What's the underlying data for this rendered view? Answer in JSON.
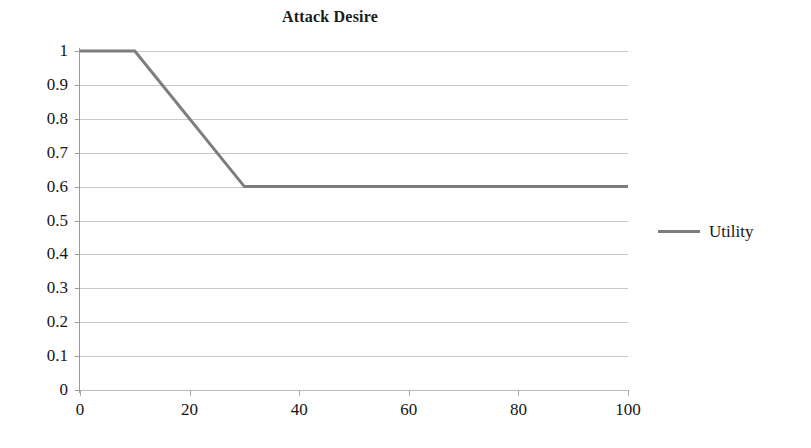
{
  "chart_data": {
    "type": "line",
    "title": "Attack Desire",
    "xlabel": "",
    "ylabel": "",
    "xlim": [
      0,
      100
    ],
    "ylim": [
      0,
      1
    ],
    "grid": true,
    "legend_position": "right",
    "x_ticks": [
      0,
      20,
      40,
      60,
      80,
      100
    ],
    "y_ticks": [
      0,
      0.1,
      0.2,
      0.3,
      0.4,
      0.5,
      0.6,
      0.7,
      0.8,
      0.9,
      1
    ],
    "x_tick_labels": [
      "0",
      "20",
      "40",
      "60",
      "80",
      "100"
    ],
    "y_tick_labels": [
      "0",
      "0.1",
      "0.2",
      "0.3",
      "0.4",
      "0.5",
      "0.6",
      "0.7",
      "0.8",
      "0.9",
      "1"
    ],
    "series": [
      {
        "name": "Utility",
        "color": "#7d7d7d",
        "x": [
          0,
          10,
          30,
          100
        ],
        "values": [
          1,
          1,
          0.6,
          0.6
        ]
      }
    ],
    "legend": [
      "Utility"
    ]
  },
  "legend": {
    "entries": [
      {
        "label": "Utility",
        "swatch": "line-swatch",
        "color": "#7d7d7d"
      }
    ]
  },
  "axes": {
    "y_labels": [
      "1",
      "0.9",
      "0.8",
      "0.7",
      "0.6",
      "0.5",
      "0.4",
      "0.3",
      "0.2",
      "0.1",
      "0"
    ],
    "x_labels": [
      "0",
      "20",
      "40",
      "60",
      "80",
      "100"
    ]
  }
}
